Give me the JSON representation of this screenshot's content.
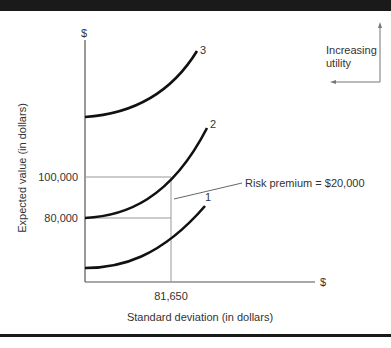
{
  "figure": {
    "y_axis_unit": "$",
    "x_axis_unit": "$",
    "y_axis_title": "Expected value (in dollars)",
    "x_axis_title": "Standard deviation (in dollars)",
    "y_ticks": [
      "100,000",
      "80,000"
    ],
    "x_ticks": [
      "81,650"
    ],
    "curves": [
      {
        "label": "1"
      },
      {
        "label": "2"
      },
      {
        "label": "3"
      }
    ],
    "annotation": "Risk premium = $20,000",
    "direction_label_line1": "Increasing",
    "direction_label_line2": "utility"
  },
  "colors": {
    "curve": "#111111",
    "guide": "#888888",
    "text": "#333333",
    "frame": "#1a1a1a"
  }
}
